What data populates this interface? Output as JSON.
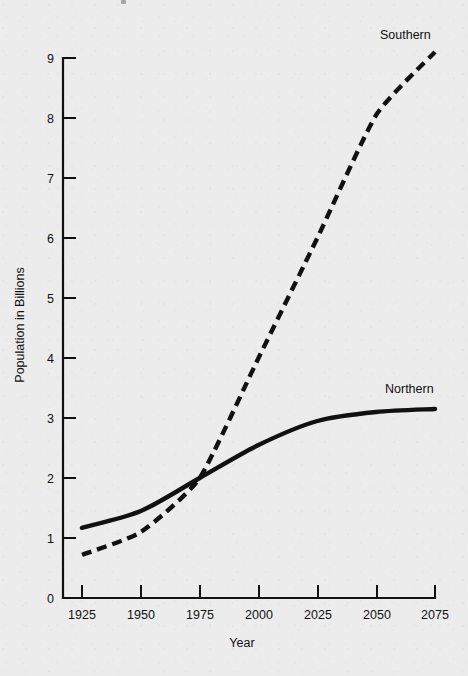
{
  "chart_data": {
    "type": "line",
    "title": "",
    "xlabel": "Year",
    "ylabel": "Population in Billions",
    "x": [
      1925,
      1950,
      1975,
      2000,
      2025,
      2050,
      2075
    ],
    "xtick_labels": [
      "1925",
      "1950",
      "1975",
      "2000",
      "2025",
      "2050",
      "2075"
    ],
    "ytick_labels": [
      "0",
      "1",
      "2",
      "3",
      "4",
      "5",
      "6",
      "7",
      "8",
      "9"
    ],
    "yticks": [
      0,
      1,
      2,
      3,
      4,
      5,
      6,
      7,
      8,
      9
    ],
    "xlim": [
      1925,
      2075
    ],
    "ylim": [
      0,
      9
    ],
    "grid": false,
    "legend_position": "inline-end-labels",
    "series": [
      {
        "name": "Northern",
        "style": "solid",
        "color": "#111111",
        "label_text": "Northern",
        "values": [
          1.17,
          1.45,
          2.0,
          2.55,
          2.95,
          3.1,
          3.15
        ]
      },
      {
        "name": "Southern",
        "style": "dashed",
        "color": "#111111",
        "label_text": "Southern",
        "values": [
          0.72,
          1.1,
          2.0,
          4.0,
          6.0,
          8.05,
          9.1
        ]
      }
    ],
    "annotations": [
      {
        "text": "Southern",
        "x": 2062,
        "y": 9.45
      },
      {
        "text": "Northern",
        "x": 2058,
        "y": 3.62
      }
    ]
  },
  "axis": {
    "x_title": "Year",
    "y_title": "Population in Billions"
  },
  "ticks": {
    "y": [
      {
        "label": "9"
      },
      {
        "label": "8"
      },
      {
        "label": "7"
      },
      {
        "label": "6"
      },
      {
        "label": "5"
      },
      {
        "label": "4"
      },
      {
        "label": "3"
      },
      {
        "label": "2"
      },
      {
        "label": "1"
      },
      {
        "label": "0"
      }
    ],
    "x": [
      {
        "label": "1925"
      },
      {
        "label": "1950"
      },
      {
        "label": "1975"
      },
      {
        "label": "2000"
      },
      {
        "label": "2025"
      },
      {
        "label": "2050"
      },
      {
        "label": "2075"
      }
    ]
  },
  "colors": {
    "background": "#ececed",
    "ink": "#111111"
  }
}
